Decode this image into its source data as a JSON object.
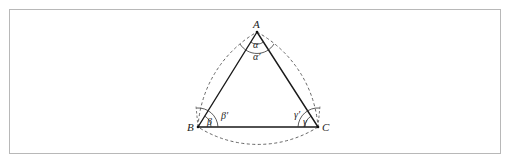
{
  "figure": {
    "type": "Reuleaux triangle construction",
    "vertices": {
      "A": {
        "label": "A",
        "x": 257,
        "y": 32
      },
      "B": {
        "label": "B",
        "x": 198,
        "y": 127
      },
      "C": {
        "label": "C",
        "x": 318,
        "y": 127
      }
    },
    "angle_labels": {
      "alpha": "α",
      "alpha_prime": "α′",
      "beta": "β",
      "beta_prime": "β′",
      "gamma": "γ",
      "gamma_prime": "γ′"
    },
    "colors": {
      "triangle_stroke": "#1a1a1a",
      "dashed_arc_stroke": "#555555",
      "frame_border": "#b8b8b8"
    }
  }
}
